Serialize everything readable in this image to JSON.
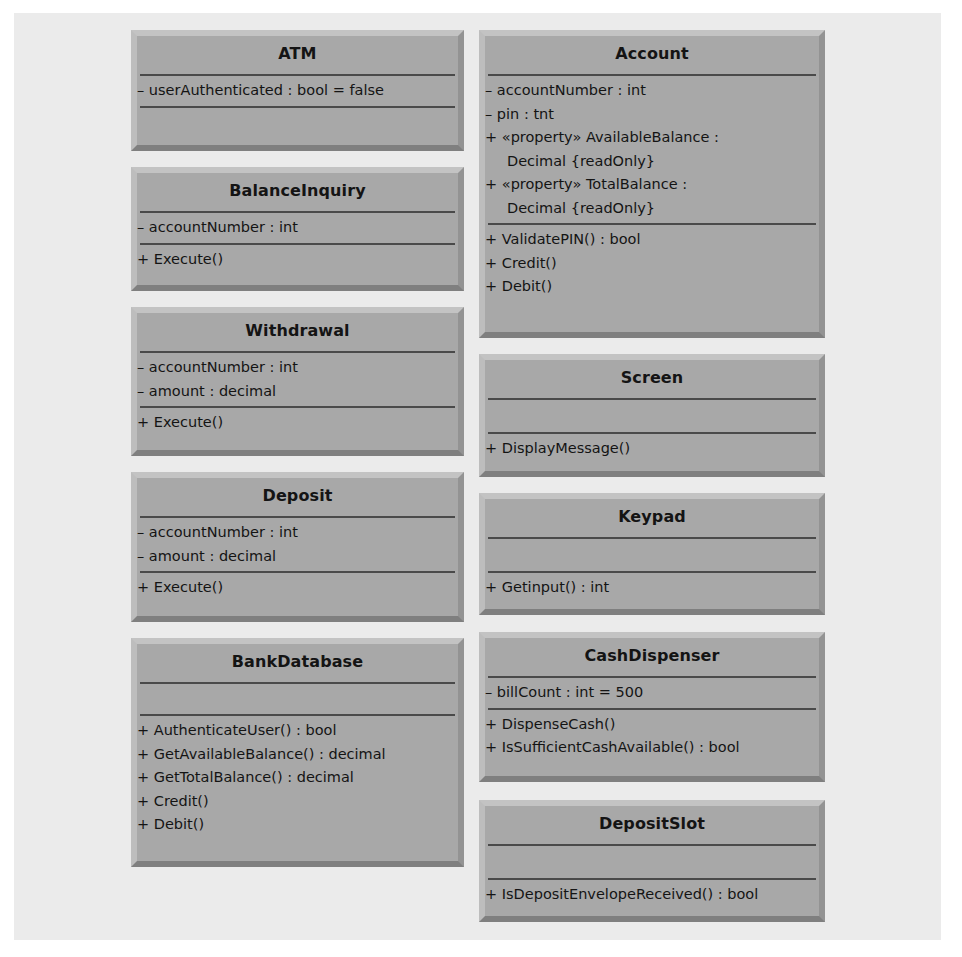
{
  "classes": {
    "atm": {
      "name": "ATM",
      "attributes": [
        "– userAuthenticated : bool = false"
      ],
      "operations": []
    },
    "balance_inquiry": {
      "name": "BalanceInquiry",
      "attributes": [
        "– accountNumber : int"
      ],
      "operations": [
        "+ Execute()"
      ]
    },
    "withdrawal": {
      "name": "Withdrawal",
      "attributes": [
        "– accountNumber : int",
        "– amount : decimal"
      ],
      "operations": [
        "+ Execute()"
      ]
    },
    "deposit": {
      "name": "Deposit",
      "attributes": [
        "– accountNumber : int",
        "– amount : decimal"
      ],
      "operations": [
        "+ Execute()"
      ]
    },
    "bank_database": {
      "name": "BankDatabase",
      "attributes": [],
      "operations": [
        "+ AuthenticateUser() : bool",
        "+ GetAvailableBalance() : decimal",
        "+ GetTotalBalance() : decimal",
        "+ Credit()",
        "+ Debit()"
      ]
    },
    "account": {
      "name": "Account",
      "attributes": [
        "– accountNumber : int",
        "– pin : tnt",
        "+ «property» AvailableBalance :",
        "Decimal {readOnly}",
        "+ «property» TotalBalance :",
        "Decimal {readOnly}"
      ],
      "operations": [
        "+ ValidatePIN() : bool",
        "+ Credit()",
        "+ Debit()"
      ]
    },
    "screen": {
      "name": "Screen",
      "attributes": [],
      "operations": [
        "+ DisplayMessage()"
      ]
    },
    "keypad": {
      "name": "Keypad",
      "attributes": [],
      "operations": [
        "+ Getinput() : int"
      ]
    },
    "cash_dispenser": {
      "name": "CashDispenser",
      "attributes": [
        "– billCount : int = 500"
      ],
      "operations": [
        "+ DispenseCash()",
        "+ IsSufficientCashAvailable() : bool"
      ]
    },
    "deposit_slot": {
      "name": "DepositSlot",
      "attributes": [],
      "operations": [
        "+ IsDepositEnvelopeReceived() : bool"
      ]
    }
  },
  "colors": {
    "panel_background": "#ebebeb",
    "class_fill": "#a8a8a8",
    "divider": "#4a4a4a",
    "text": "#141414"
  }
}
